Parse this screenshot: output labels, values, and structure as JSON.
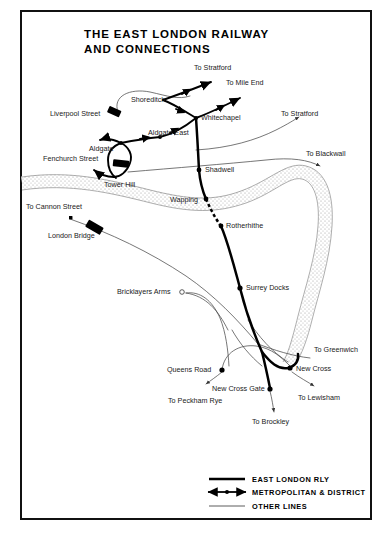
{
  "document": {
    "title_line1": "THE  EAST  LONDON  RAILWAY",
    "title_line2": "AND   CONNECTIONS",
    "frame_color": "#111111",
    "background_color": "#ffffff"
  },
  "map": {
    "type": "railway-schematic-map",
    "region": "East London",
    "river": {
      "name": "River Thames",
      "style": "stippled band",
      "labeled": false
    },
    "stations": [
      {
        "id": "liverpool-street",
        "label": "Liverpool Street",
        "marker": "terminus-block",
        "x": 113,
        "y": 114,
        "label_x": 50,
        "label_y": 116
      },
      {
        "id": "shoreditch",
        "label": "Shoreditch",
        "marker": "none",
        "x": 163,
        "y": 100,
        "label_x": 131,
        "label_y": 102
      },
      {
        "id": "whitechapel",
        "label": "Whitechapel",
        "marker": "junction",
        "x": 196,
        "y": 118,
        "label_x": 201,
        "label_y": 120
      },
      {
        "id": "aldgate-east",
        "label": "Aldgate East",
        "marker": "junction",
        "x": 160,
        "y": 137,
        "label_x": 148,
        "label_y": 135
      },
      {
        "id": "aldgate",
        "label": "Aldgate",
        "marker": "junction",
        "x": 121,
        "y": 143,
        "label_x": 89,
        "label_y": 151
      },
      {
        "id": "fenchurch-street",
        "label": "Fenchurch Street",
        "marker": "terminus-block",
        "x": 121,
        "y": 164,
        "label_x": 43,
        "label_y": 161
      },
      {
        "id": "tower-hill",
        "label": "Tower Hill",
        "marker": "none",
        "x": 115,
        "y": 175,
        "label_x": 104,
        "label_y": 187
      },
      {
        "id": "shadwell",
        "label": "Shadwell",
        "marker": "station-dot",
        "x": 199,
        "y": 170,
        "label_x": 205,
        "label_y": 172
      },
      {
        "id": "wapping",
        "label": "Wapping",
        "marker": "station-dot",
        "x": 206,
        "y": 199,
        "label_x": 170,
        "label_y": 202
      },
      {
        "id": "rotherhithe",
        "label": "Rotherhithe",
        "marker": "station-dot",
        "x": 221,
        "y": 226,
        "label_x": 226,
        "label_y": 228
      },
      {
        "id": "surrey-docks",
        "label": "Surrey Docks",
        "marker": "station-dot",
        "x": 240,
        "y": 288,
        "label_x": 246,
        "label_y": 290
      },
      {
        "id": "bricklayers-arms",
        "label": "Bricklayers Arms",
        "marker": "open-circle",
        "x": 181,
        "y": 292,
        "label_x": 117,
        "label_y": 293
      },
      {
        "id": "queens-road",
        "label": "Queens Road",
        "marker": "station-dot",
        "x": 222,
        "y": 370,
        "label_x": 167,
        "label_y": 372
      },
      {
        "id": "new-cross",
        "label": "New Cross",
        "marker": "station-dot",
        "x": 290,
        "y": 368,
        "label_x": 295,
        "label_y": 370
      },
      {
        "id": "new-cross-gate",
        "label": "New Cross Gate",
        "marker": "station-dot",
        "x": 270,
        "y": 388,
        "label_x": 212,
        "label_y": 390
      }
    ],
    "destinations": [
      {
        "id": "to-stratford-north",
        "label": "To Stratford",
        "label_x": 194,
        "label_y": 70,
        "arrow_x": 214,
        "arrow_y": 84
      },
      {
        "id": "to-mile-end",
        "label": "To Mile End",
        "label_x": 226,
        "label_y": 85,
        "arrow_x": 243,
        "arrow_y": 99
      },
      {
        "id": "to-stratford-east",
        "label": "To Stratford",
        "label_x": 281,
        "label_y": 116,
        "arrow_x": 301,
        "arrow_y": 124
      },
      {
        "id": "to-blackwall",
        "label": "To Blackwall",
        "label_x": 306,
        "label_y": 156,
        "arrow_x": 322,
        "arrow_y": 170
      },
      {
        "id": "to-cannon-street",
        "label": "To Cannon Street",
        "label_x": 26,
        "label_y": 209,
        "arrow_x": 69,
        "arrow_y": 218
      },
      {
        "id": "london-bridge",
        "label": "London Bridge",
        "label_x": 48,
        "label_y": 236,
        "arrow_x": 0,
        "arrow_y": 0
      },
      {
        "id": "to-greenwich",
        "label": "To Greenwich",
        "label_x": 314,
        "label_y": 352,
        "arrow_x": 0,
        "arrow_y": 0
      },
      {
        "id": "to-lewisham",
        "label": "To Lewisham",
        "label_x": 298,
        "label_y": 399,
        "arrow_x": 315,
        "arrow_y": 387
      },
      {
        "id": "to-peckham-rye",
        "label": "To Peckham Rye",
        "label_x": 168,
        "label_y": 402,
        "arrow_x": 206,
        "arrow_y": 385
      },
      {
        "id": "to-brockley",
        "label": "To Brockley",
        "label_x": 252,
        "label_y": 424,
        "arrow_x": 274,
        "arrow_y": 414
      }
    ]
  },
  "legend": {
    "items": [
      {
        "id": "east-london-rly",
        "label": "EAST  LONDON  RLY",
        "style": "thick-solid"
      },
      {
        "id": "metropolitan-district",
        "label": "METROPOLITAN & DISTRICT",
        "style": "arrowed-line"
      },
      {
        "id": "other-lines",
        "label": "OTHER LINES",
        "style": "thin-solid"
      }
    ]
  }
}
